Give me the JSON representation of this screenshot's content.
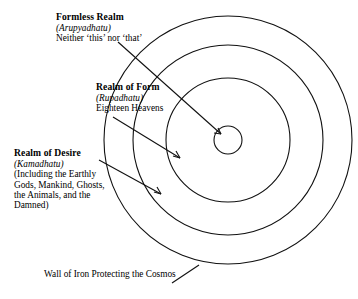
{
  "diagram": {
    "type": "concentric-circles",
    "stroke_color": "#111111",
    "background_color": "#ffffff",
    "center": {
      "x": 228,
      "y": 140
    },
    "circles": [
      {
        "name": "outer-wall-of-iron",
        "radius": 124
      },
      {
        "name": "realm-of-desire-boundary",
        "radius": 95
      },
      {
        "name": "realm-of-form-boundary",
        "radius": 62
      },
      {
        "name": "formless-realm-core",
        "radius": 14
      }
    ]
  },
  "labels": {
    "formless": {
      "title": "Formless Realm",
      "sanskrit": "(Arupyadhatu)",
      "desc": "Neither ‘this’ nor ‘that’"
    },
    "form": {
      "title": "Realm of Form",
      "sanskrit": "(Rupadhatu)",
      "desc": "Eighteen Heavens"
    },
    "desire": {
      "title": "Realm of Desire",
      "sanskrit": "(Kamadhatu)",
      "desc_line1": "(Including the Earthly",
      "desc_line2": "Gods, Mankind, Ghosts,",
      "desc_line3": "the Animals, and the",
      "desc_line4": "Damned)"
    },
    "wall": {
      "desc": "Wall of Iron Protecting the Cosmos"
    }
  }
}
